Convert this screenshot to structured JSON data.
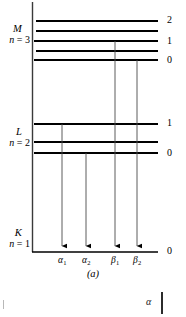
{
  "figure": {
    "caption": "(a)",
    "type": "x-ray-energy-level-diagram"
  },
  "axis": {
    "x": 32,
    "top": 2,
    "bottom": 252,
    "baseline_right": 158
  },
  "shells": [
    {
      "id": "M",
      "letter": "M",
      "n_label": "n = 3",
      "n_prefix": "n",
      "n_suffix": " = 3",
      "label_top": 24,
      "levels": [
        {
          "y": 21,
          "number": "2",
          "x_start": 36,
          "x_end": 158
        },
        {
          "y": 31,
          "number": "",
          "x_start": 36,
          "x_end": 158
        },
        {
          "y": 41,
          "number": "1",
          "x_start": 34,
          "x_end": 158
        },
        {
          "y": 51,
          "number": "",
          "x_start": 36,
          "x_end": 158
        },
        {
          "y": 60,
          "number": "0",
          "x_start": 34,
          "x_end": 158
        }
      ]
    },
    {
      "id": "L",
      "letter": "L",
      "n_label": "n = 2",
      "n_prefix": "n",
      "n_suffix": " = 2",
      "label_top": 127,
      "levels": [
        {
          "y": 124,
          "number": "1",
          "x_start": 34,
          "x_end": 158
        },
        {
          "y": 142,
          "number": "",
          "x_start": 34,
          "x_end": 158
        },
        {
          "y": 153,
          "number": "0",
          "x_start": 34,
          "x_end": 158
        }
      ]
    },
    {
      "id": "K",
      "letter": "K",
      "n_label": "n = 1",
      "n_prefix": "n",
      "n_suffix": " = 1",
      "label_top": 228,
      "levels": [
        {
          "y": 252,
          "number": "0",
          "x_start": 32,
          "x_end": 158
        }
      ]
    }
  ],
  "transitions": [
    {
      "id": "alpha1",
      "greek": "α",
      "sub": "1",
      "x": 62,
      "y_from": 124,
      "y_to": 250,
      "label_left": 50
    },
    {
      "id": "alpha2",
      "greek": "α",
      "sub": "2",
      "x": 86,
      "y_from": 153,
      "y_to": 250,
      "label_left": 74
    },
    {
      "id": "beta1",
      "greek": "β",
      "sub": "1",
      "x": 115,
      "y_from": 41,
      "y_to": 250,
      "label_left": 103
    },
    {
      "id": "beta2",
      "greek": "β",
      "sub": "2",
      "x": 137,
      "y_from": 60,
      "y_to": 250,
      "label_left": 125
    }
  ],
  "number_labels": [
    {
      "text": "2",
      "x": 167,
      "y": 15
    },
    {
      "text": "1",
      "x": 167,
      "y": 36
    },
    {
      "text": "0",
      "x": 167,
      "y": 55
    },
    {
      "text": "1",
      "x": 167,
      "y": 118
    },
    {
      "text": "0",
      "x": 167,
      "y": 148
    },
    {
      "text": "0",
      "x": 167,
      "y": 246
    }
  ],
  "artifacts": {
    "alpha_fragment": "α"
  },
  "colors": {
    "ink": "#000000",
    "thin_line": "#555555",
    "background": "#ffffff"
  }
}
